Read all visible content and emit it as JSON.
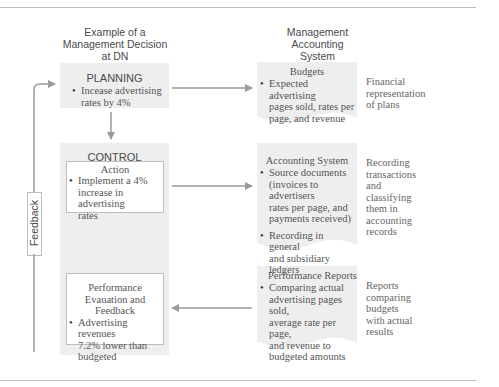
{
  "column_headers": {
    "left": "Example of a Management Decision at DN",
    "left_lines": [
      "Example of a",
      "Management Decision",
      "at DN"
    ],
    "right_lines": [
      "Management",
      "Accounting",
      "System"
    ]
  },
  "planning": {
    "title": "PLANNING",
    "bullet_lines": [
      "Incease advertising",
      "rates by 4%"
    ]
  },
  "control": {
    "title": "CONTROL",
    "action": {
      "title": "Action",
      "bullet_lines": [
        "Implement a 4%",
        "increase in advertising",
        "rates"
      ]
    },
    "performance": {
      "title_lines": [
        "Performance",
        "Evauation and Feedback"
      ],
      "bullet_lines": [
        "Advertising revenues",
        "7.2% lower than",
        "budgeted"
      ]
    }
  },
  "feedback_label": "Feedback",
  "system": {
    "budgets": {
      "title": "Budgets",
      "bullet_lines": [
        "Expected advertising",
        "pages sold, rates per",
        "page, and revenue"
      ],
      "note_lines": [
        "Financial",
        "representation",
        "of plans"
      ]
    },
    "accounting": {
      "title": "Accounting System",
      "bullet1_lines": [
        "Source documents",
        "(invoices to advertisers",
        "rates per page, and",
        "payments received)"
      ],
      "bullet2_lines": [
        "Recording in general",
        "and subsidiary ledgers"
      ],
      "note_lines": [
        "Recording",
        "transactions",
        "and",
        "classifying",
        "them in",
        "accounting",
        "records"
      ]
    },
    "reports": {
      "title": "Performance Reports",
      "bullet_lines": [
        "Comparing actual",
        "advertising pages sold,",
        "average rate per page,",
        "and revenue to",
        "budgeted amounts"
      ],
      "note_lines": [
        "Reports",
        "comparing",
        "budgets",
        "with actual",
        "results"
      ]
    }
  },
  "colors": {
    "panel": "#eeeeee",
    "arrow": "#9a9a9a",
    "rule": "#bdbdbd"
  }
}
